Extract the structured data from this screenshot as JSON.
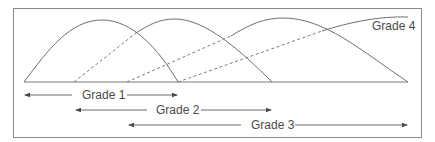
{
  "diagram": {
    "type": "overlapping-grade-distribution",
    "colors": {
      "line": "#6f6f6f",
      "frame": "#8a8a8a",
      "text": "#4a4a4a",
      "background": "#ffffff"
    },
    "curves": [
      {
        "id": "grade-1",
        "label": "Grade 1",
        "start_x": 24,
        "peak_x": 102,
        "end_x": 178
      },
      {
        "id": "grade-2",
        "label": "Grade 2",
        "start_x": 74,
        "peak_x": 175,
        "end_x": 272
      },
      {
        "id": "grade-3",
        "label": "Grade 3",
        "start_x": 127,
        "peak_x": 283,
        "end_x": 408
      },
      {
        "id": "grade-4",
        "label": "Grade 4",
        "start_x": 178,
        "peak_x": 408,
        "end_x": null
      }
    ],
    "curve_label": "Grade 4",
    "ranges": [
      {
        "label": "Grade 1",
        "from": 24,
        "to": 178
      },
      {
        "label": "Grade 2",
        "from": 75,
        "to": 272
      },
      {
        "label": "Grade 3",
        "from": 128,
        "to": 408
      }
    ]
  }
}
